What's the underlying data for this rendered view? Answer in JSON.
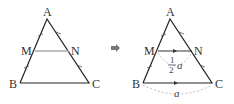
{
  "left_figure": {
    "labels": {
      "A": "A",
      "M": "M",
      "N": "N",
      "B": "B",
      "C": "C"
    }
  },
  "transition_arrow": "➡",
  "right_figure": {
    "labels": {
      "A": "A",
      "M": "M",
      "N": "N",
      "B": "B",
      "C": "C"
    },
    "mn_length": {
      "numerator": "1",
      "denominator": "2",
      "variable": "a"
    },
    "bc_length": "a"
  },
  "colors": {
    "line": "#222222",
    "midsegment_left": "#aaaaaa",
    "dashed": "#aaaaaa",
    "arrow": "#777777"
  }
}
